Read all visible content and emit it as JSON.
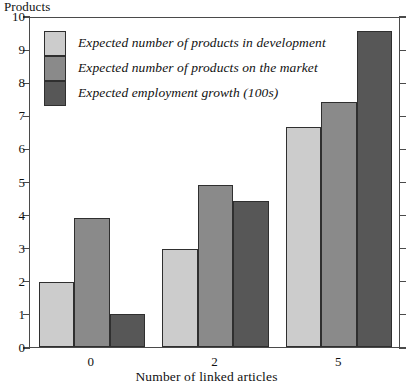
{
  "chart_data": {
    "type": "bar",
    "title": "",
    "categories": [
      "0",
      "2",
      "5"
    ],
    "series": [
      {
        "name": "Expected number of products in development",
        "color": "#cccccc",
        "values": [
          1.95,
          2.95,
          6.65
        ]
      },
      {
        "name": "Expected number of products on the market",
        "color": "#8a8a8a",
        "values": [
          3.9,
          4.88,
          7.4
        ]
      },
      {
        "name": "Expected employment growth (100s)",
        "color": "#575757",
        "values": [
          1.0,
          4.42,
          9.55
        ]
      }
    ],
    "xlabel": "Number of linked articles",
    "ylabel": "Products",
    "ylim": [
      0,
      10
    ],
    "yticks": [
      "0",
      "1",
      "2",
      "3",
      "4",
      "5",
      "6",
      "7",
      "8",
      "9",
      "10"
    ],
    "grid": false,
    "legend_position": "top-left"
  },
  "axes": {
    "y_title": "Products",
    "x_title": "Number of linked articles",
    "y_ticks": [
      "10",
      "9",
      "8",
      "7",
      "6",
      "5",
      "4",
      "3",
      "2",
      "1",
      "0"
    ],
    "x_ticks": [
      "0",
      "2",
      "5"
    ]
  },
  "legend": {
    "items": [
      {
        "label": "Expected number of products in development",
        "color": "#cccccc"
      },
      {
        "label": "Expected number of products on the market",
        "color": "#8a8a8a"
      },
      {
        "label": "Expected employment growth (100s)",
        "color": "#575757"
      }
    ]
  },
  "colors": {
    "series_light": "#cccccc",
    "series_medium": "#8a8a8a",
    "series_dark": "#575757",
    "frame": "#4a4a4a",
    "bar_outline": "#2f2f2f",
    "background": "#ffffff",
    "text": "#111111"
  }
}
